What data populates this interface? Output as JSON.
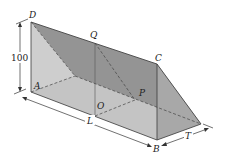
{
  "diagram": {
    "type": "3d-triangular-prism",
    "vertices": {
      "D": "D",
      "Q": "Q",
      "C": "C",
      "A": "A",
      "O": "O",
      "P": "P",
      "B": "B"
    },
    "dimensions": {
      "height": "100",
      "length": "L",
      "thickness": "T"
    },
    "colors": {
      "back_face": "#b9b9b9",
      "top_face": "#8c8c8c",
      "end_face": "#a6a6a6",
      "floor": "#e4e4e4",
      "line": "#3a3a3a"
    }
  }
}
